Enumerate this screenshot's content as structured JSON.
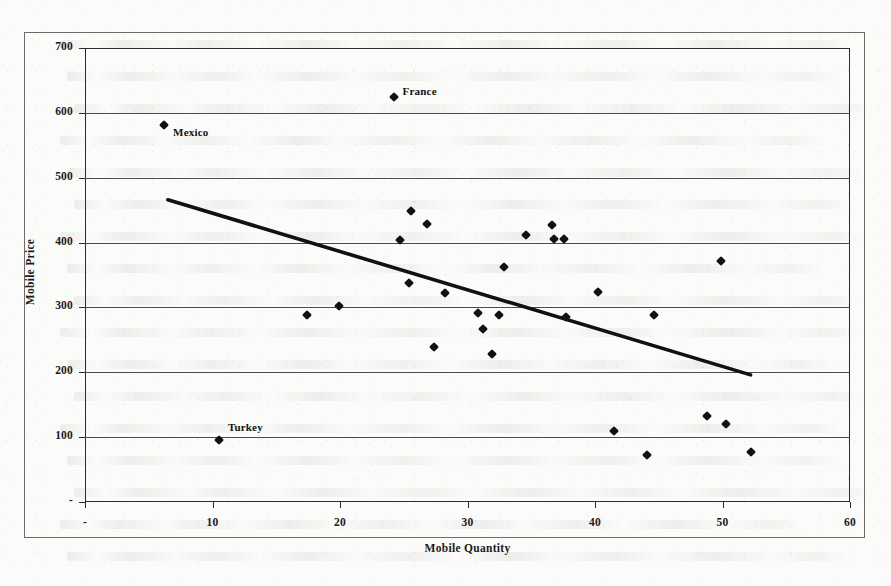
{
  "figure": {
    "background_color": "#fbfbf9",
    "frame_color": "#6e6c68",
    "axis_color": "#2b2b2b",
    "gridline_color": "#4b4b4b",
    "marker_color": "#111111",
    "trendline_color": "#111111"
  },
  "chart_data": {
    "type": "scatter",
    "title": "",
    "subtitle": "",
    "xlabel": "Mobile Quantity",
    "ylabel": "Mobile Price",
    "xlim": [
      0,
      60
    ],
    "ylim": [
      0,
      700
    ],
    "xticks": [
      0,
      10,
      20,
      30,
      40,
      50,
      60
    ],
    "xticklabels": [
      "-",
      "10",
      "20",
      "30",
      "40",
      "50",
      "60"
    ],
    "yticks": [
      0,
      100,
      200,
      300,
      400,
      500,
      600,
      700
    ],
    "yticklabels": [
      "-",
      "100",
      "200",
      "300",
      "400",
      "500",
      "600",
      "700"
    ],
    "grid": "horizontal",
    "legend": "none",
    "marker_style": "filled-diamond",
    "series": [
      {
        "name": "Mobile Price vs Mobile Quantity",
        "points": [
          {
            "x": 6.2,
            "y": 582,
            "label": "Mexico"
          },
          {
            "x": 24.2,
            "y": 625,
            "label": "France"
          },
          {
            "x": 10.5,
            "y": 96,
            "label": "Turkey"
          },
          {
            "x": 17.4,
            "y": 289,
            "label": ""
          },
          {
            "x": 19.9,
            "y": 302,
            "label": ""
          },
          {
            "x": 24.7,
            "y": 404,
            "label": ""
          },
          {
            "x": 25.4,
            "y": 338,
            "label": ""
          },
          {
            "x": 25.6,
            "y": 449,
            "label": ""
          },
          {
            "x": 26.8,
            "y": 429,
            "label": ""
          },
          {
            "x": 27.4,
            "y": 239,
            "label": ""
          },
          {
            "x": 28.2,
            "y": 322,
            "label": ""
          },
          {
            "x": 30.8,
            "y": 292,
            "label": ""
          },
          {
            "x": 31.2,
            "y": 266,
            "label": ""
          },
          {
            "x": 31.9,
            "y": 228,
            "label": ""
          },
          {
            "x": 32.5,
            "y": 289,
            "label": ""
          },
          {
            "x": 32.9,
            "y": 363,
            "label": ""
          },
          {
            "x": 34.6,
            "y": 411,
            "label": ""
          },
          {
            "x": 36.6,
            "y": 427,
            "label": ""
          },
          {
            "x": 36.8,
            "y": 406,
            "label": ""
          },
          {
            "x": 37.6,
            "y": 405,
            "label": ""
          },
          {
            "x": 37.7,
            "y": 285,
            "label": ""
          },
          {
            "x": 40.2,
            "y": 324,
            "label": ""
          },
          {
            "x": 41.5,
            "y": 109,
            "label": ""
          },
          {
            "x": 44.1,
            "y": 73,
            "label": ""
          },
          {
            "x": 44.6,
            "y": 289,
            "label": ""
          },
          {
            "x": 48.8,
            "y": 133,
            "label": ""
          },
          {
            "x": 49.9,
            "y": 371,
            "label": ""
          },
          {
            "x": 50.3,
            "y": 121,
            "label": ""
          },
          {
            "x": 52.2,
            "y": 77,
            "label": ""
          }
        ]
      }
    ],
    "trendline": {
      "type": "linear",
      "x_start": 6.5,
      "y_start": 466,
      "x_end": 52.2,
      "y_end": 196
    },
    "annotations": [
      {
        "text": "France",
        "x": 24.2,
        "y": 625
      },
      {
        "text": "Mexico",
        "x": 6.2,
        "y": 582
      },
      {
        "text": "Turkey",
        "x": 10.5,
        "y": 96
      }
    ]
  }
}
